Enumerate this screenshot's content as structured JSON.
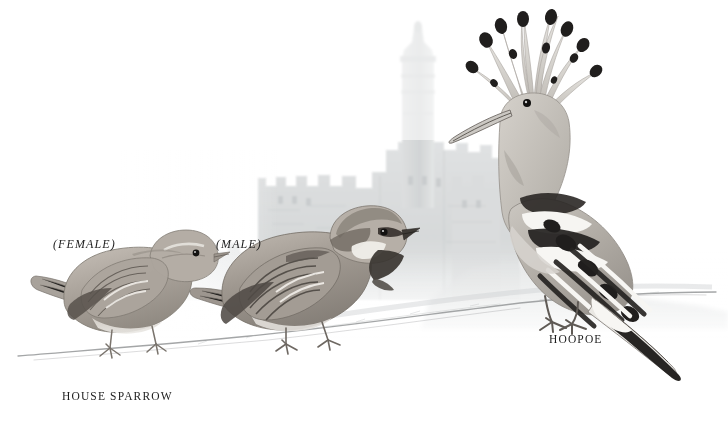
{
  "plate": {
    "width": 728,
    "height": 423,
    "background_color": "#ffffff",
    "medium": "watercolour-and-pencil field-guide illustration",
    "scene_description": "Three birds perched on a sketchy ground line in front of a faintly washed stone citadel with a minaret tower"
  },
  "captions": [
    {
      "id": "female",
      "text": "(FEMALE)",
      "style": "italic",
      "color": "#1d1d1d",
      "x": 53,
      "y": 237
    },
    {
      "id": "male",
      "text": "(MALE)",
      "style": "italic",
      "color": "#1d1d1d",
      "x": 216,
      "y": 237
    },
    {
      "id": "house_sparrow",
      "text": "HOUSE SPARROW",
      "style": "caps",
      "color": "#1d1d1d",
      "x": 62,
      "y": 390
    },
    {
      "id": "hoopoe",
      "text": "HOOPOE",
      "style": "caps",
      "color": "#1d1d1d",
      "x": 549,
      "y": 333
    }
  ],
  "subjects": [
    {
      "name": "house-sparrow-female",
      "common_name": "House Sparrow",
      "sex": "female",
      "plumage": "plain pale grey-brown, buff supercilium, streaked wings, no black bib",
      "pose": "perched facing right, tail to the left",
      "bbox": [
        30,
        245,
        230,
        365
      ]
    },
    {
      "name": "house-sparrow-male",
      "common_name": "House Sparrow",
      "sex": "male",
      "plumage": "grey crown, chestnut nape, black bib and lores, white cheek, streaked chestnut wings",
      "pose": "perched facing right, tail to the left",
      "bbox": [
        195,
        205,
        395,
        345
      ]
    },
    {
      "name": "hoopoe",
      "common_name": "Hoopoe",
      "sex": "",
      "plumage": "pinkish-buff head and breast, erect black-tipped crest, boldly black-and-white barred wings and tail, long decurved bill",
      "pose": "standing upright facing left, tail angled down to the right",
      "bbox": [
        440,
        10,
        700,
        375
      ]
    }
  ],
  "background": {
    "name": "citadel",
    "description": "Tower of David style citadel: crenellated stone walls with a tall round minaret",
    "wash_color": "#d8dadb",
    "tower": {
      "x": 400,
      "y": 30,
      "width": 34,
      "height": 175
    },
    "wall_top_y": 175,
    "wall_span_x": [
      258,
      520
    ]
  },
  "ground": {
    "name": "ground-line",
    "description": "thin sketchy pencil ground line rising slightly to the right",
    "color": "#9a9c9d",
    "left_y": 352,
    "right_y": 300
  },
  "palette": {
    "paper": "#ffffff",
    "ink": "#1d1d1d",
    "pencil_grey": "#8d9093",
    "wash_grey": "#d8dadb",
    "sparrow_warm": "#a49a90",
    "sparrow_dark": "#5b5550",
    "hoopoe_buff": "#b9b4ae",
    "hoopoe_black": "#221f1e"
  }
}
